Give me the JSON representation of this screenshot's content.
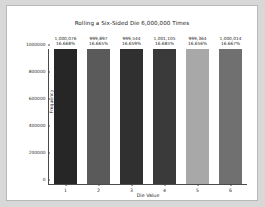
{
  "figure": {
    "background": "#ffffff",
    "page_background": "#d8d8d8",
    "frame_color": "#b9b9b9"
  },
  "chart_data": {
    "type": "bar",
    "title": "Rolling a Six-Sided Die 6,000,000 Times",
    "xlabel": "Die Value",
    "ylabel": "Frequency",
    "categories": [
      "1",
      "2",
      "3",
      "4",
      "5",
      "6"
    ],
    "values": [
      1000076,
      999897,
      999544,
      1001105,
      999364,
      1000014
    ],
    "bar_labels": [
      {
        "count": "1,000,076",
        "percent": "16.668%"
      },
      {
        "count": "999,897",
        "percent": "16.665%"
      },
      {
        "count": "999,544",
        "percent": "16.659%"
      },
      {
        "count": "1,001,105",
        "percent": "16.685%"
      },
      {
        "count": "999,364",
        "percent": "16.656%"
      },
      {
        "count": "1,000,014",
        "percent": "16.667%"
      }
    ],
    "bar_colors": [
      "#262626",
      "#5a5a5a",
      "#303030",
      "#3a3a3a",
      "#a8a8a8",
      "#707070"
    ],
    "ylim": [
      0,
      1000000
    ],
    "yticks": [
      0,
      200000,
      400000,
      600000,
      800000,
      1000000
    ],
    "ytick_labels": [
      "0",
      "200000",
      "400000",
      "600000",
      "800000",
      "1000000"
    ],
    "xticks": [
      "1",
      "2",
      "3",
      "4",
      "5",
      "6"
    ],
    "grid": false,
    "legend": null,
    "total_rolls": 6000000
  }
}
